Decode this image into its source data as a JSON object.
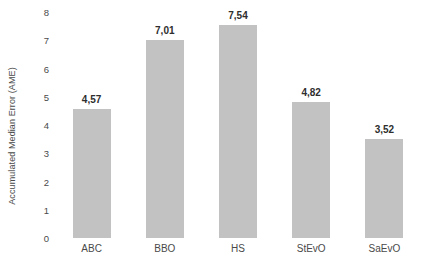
{
  "chart_data": {
    "type": "bar",
    "title": "",
    "subtitle": "",
    "xlabel": "",
    "ylabel": "Accumulated Median Error (AME)",
    "categories": [
      "ABC",
      "BBO",
      "HS",
      "StEvO",
      "SaEvO"
    ],
    "values": [
      4.57,
      7.01,
      7.54,
      4.82,
      3.52
    ],
    "value_labels": [
      "4,57",
      "7,01",
      "7,54",
      "4,82",
      "3,52"
    ],
    "decimal_separator": ",",
    "ylim": [
      0,
      8
    ],
    "y_ticks": [
      0,
      1,
      2,
      3,
      4,
      5,
      6,
      7,
      8
    ],
    "y_tick_labels": [
      "0",
      "1",
      "2",
      "3",
      "4",
      "5",
      "6",
      "7",
      "8"
    ],
    "grid": false,
    "legend": false,
    "legend_position": "none",
    "series": [
      {
        "name": "Accumulated Median Error (AME)",
        "values": [
          4.57,
          7.01,
          7.54,
          4.82,
          3.52
        ]
      }
    ],
    "colors": {
      "bar_fill": "#c2c2c2",
      "background": "#ffffff",
      "text": "#4a4a4a",
      "value_label_text": "#2e2e2e"
    }
  }
}
